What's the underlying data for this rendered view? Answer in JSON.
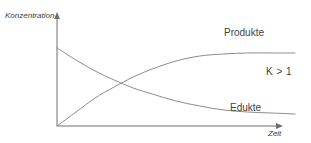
{
  "chart_data": {
    "type": "line",
    "title": "",
    "subtitle": "",
    "xlabel": "Zeit",
    "ylabel": "Konzentration",
    "xlim": [
      0,
      1
    ],
    "ylim": [
      0,
      1
    ],
    "grid": false,
    "legend_position": "inline-right",
    "axes": {
      "x_axis_arrow": true,
      "y_axis_arrow": true,
      "x_tick_labels": [],
      "y_tick_labels": []
    },
    "annotations": [
      {
        "name": "equilibrium-constant",
        "text": "K > 1"
      }
    ],
    "series": [
      {
        "name": "Edukte",
        "label": "Edukte",
        "color": "#8c8c8c",
        "shape": "exponential-decay",
        "start_value": 0.78,
        "end_value": 0.12,
        "x": [
          0.0,
          0.08,
          0.16,
          0.24,
          0.32,
          0.4,
          0.5,
          0.6,
          0.7,
          0.8,
          0.9,
          1.0
        ],
        "values": [
          0.78,
          0.66,
          0.55,
          0.46,
          0.38,
          0.32,
          0.25,
          0.2,
          0.16,
          0.14,
          0.13,
          0.12
        ]
      },
      {
        "name": "Produkte",
        "label": "Produkte",
        "color": "#8c8c8c",
        "shape": "exponential-rise",
        "start_value": 0.0,
        "end_value": 0.73,
        "x": [
          0.0,
          0.08,
          0.16,
          0.24,
          0.32,
          0.4,
          0.5,
          0.6,
          0.7,
          0.8,
          0.9,
          1.0
        ],
        "values": [
          0.0,
          0.14,
          0.28,
          0.39,
          0.49,
          0.57,
          0.65,
          0.7,
          0.72,
          0.73,
          0.73,
          0.73
        ]
      }
    ],
    "crossing_point": {
      "x": 0.17,
      "y": 0.53
    }
  },
  "labels": {
    "y_axis": "Konzentration",
    "x_axis": "Zeit",
    "produkte": "Produkte",
    "edukte": "Edukte",
    "k_value": "K > 1"
  },
  "colors": {
    "background": "#ffffff",
    "axis": "#6e6e6e",
    "curve": "#8c8c8c",
    "text": "#3f3f3f"
  }
}
